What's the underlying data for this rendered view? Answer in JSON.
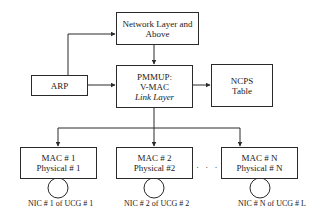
{
  "diagram": {
    "nodes": {
      "network_layer": {
        "lines": [
          "Network Layer and",
          "Above"
        ]
      },
      "arp": {
        "lines": [
          "ARP"
        ]
      },
      "pmmup": {
        "lines": [
          "PMMUP:",
          "V-MAC"
        ],
        "subtitle": "Link Layer"
      },
      "ncps": {
        "lines": [
          "NCPS",
          "Table"
        ]
      },
      "mac1": {
        "lines": [
          "MAC # 1",
          "Physical # 1"
        ]
      },
      "mac2": {
        "lines": [
          "MAC # 2",
          "Physical #2"
        ]
      },
      "macn": {
        "lines": [
          "MAC # N",
          "Physical # N"
        ]
      }
    },
    "nic_labels": [
      "NIC # 1 of UCG # 1",
      "NIC # 2 of UCG # 2",
      "NIC # N of UCG # L"
    ],
    "ellipsis": "· · ·",
    "edges": [
      {
        "from": "arp",
        "to": "network_layer",
        "type": "arrow"
      },
      {
        "from": "network_layer",
        "to": "pmmup",
        "type": "bidirectional"
      },
      {
        "from": "pmmup",
        "to": "arp",
        "type": "bidirectional"
      },
      {
        "from": "pmmup",
        "to": "ncps",
        "type": "bidirectional"
      },
      {
        "from": "pmmup",
        "to": "mac1",
        "type": "arrow"
      },
      {
        "from": "pmmup",
        "to": "mac2",
        "type": "arrow"
      },
      {
        "from": "pmmup",
        "to": "macn",
        "type": "arrow"
      }
    ]
  }
}
